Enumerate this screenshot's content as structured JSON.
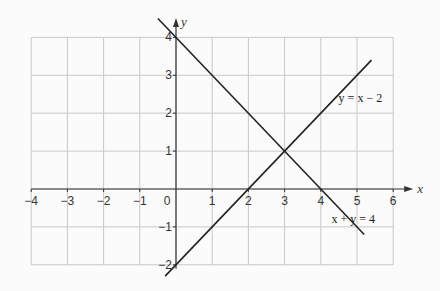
{
  "chart_data": {
    "type": "line",
    "title": "",
    "xlabel": "x",
    "ylabel": "y",
    "xlim": [
      -4,
      6
    ],
    "ylim": [
      -2,
      4
    ],
    "grid": true,
    "x_ticks": [
      -4,
      -3,
      -2,
      -1,
      0,
      1,
      2,
      3,
      4,
      5,
      6
    ],
    "y_ticks": [
      -2,
      -1,
      1,
      2,
      3,
      4
    ],
    "x_tick_labels": [
      "−4",
      "−3",
      "−2",
      "−1",
      "0",
      "1",
      "2",
      "3",
      "4",
      "5",
      "6"
    ],
    "y_tick_labels": [
      "−2",
      "−1",
      "1",
      "2",
      "3",
      "4"
    ],
    "series": [
      {
        "name": "x + y = 4",
        "equation": "x + y = 4",
        "x": [
          -0.5,
          5.2
        ],
        "y": [
          4.5,
          -1.2
        ],
        "color": "#222222"
      },
      {
        "name": "y = x − 2",
        "equation": "y = x − 2",
        "x": [
          -0.3,
          5.4
        ],
        "y": [
          -2.3,
          3.4
        ],
        "color": "#222222"
      }
    ],
    "annotations": [
      {
        "text": "y = x − 2",
        "x": 5.1,
        "y": 2.4
      },
      {
        "text": "x + y = 4",
        "x": 4.9,
        "y": -0.8
      }
    ],
    "intersection": {
      "x": 3,
      "y": 1
    },
    "legend": "none (inline line labels)"
  },
  "labels": {
    "x_axis": "x",
    "y_axis": "y",
    "line1": "y = x − 2",
    "line2": "x + y = 4"
  },
  "colors": {
    "grid": "#c8c8c8",
    "axis": "#333333",
    "line": "#222222",
    "background": "#fbfbfb"
  }
}
